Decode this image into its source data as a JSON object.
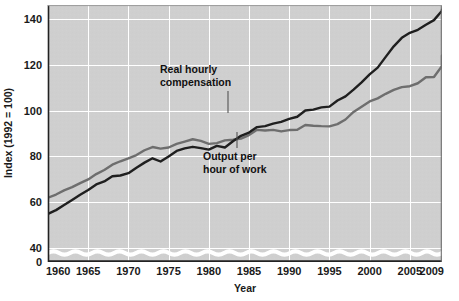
{
  "chart_data": {
    "type": "line",
    "title": "",
    "xlabel": "Year",
    "ylabel": "Index (1992 = 100)",
    "xlim": [
      1960,
      2009
    ],
    "ylim": [
      34,
      146
    ],
    "y_axis_break": true,
    "y_axis_break_note": "wavy break between 0 and 40",
    "grid": true,
    "grid_color": "#ffffff",
    "plot_background": "#cfcfcf",
    "legend_position": "inline annotations",
    "xticks": [
      "1960",
      "1965",
      "1970",
      "1975",
      "1980",
      "1985",
      "1990",
      "1995",
      "2000",
      "2005",
      "2009"
    ],
    "xtick_values": [
      1960,
      1965,
      1970,
      1975,
      1980,
      1985,
      1990,
      1995,
      2000,
      2005,
      2009
    ],
    "yticks": [
      "0",
      "40",
      "60",
      "80",
      "100",
      "120",
      "140"
    ],
    "ytick_values": [
      0,
      40,
      60,
      80,
      100,
      120,
      140
    ],
    "x": [
      1960,
      1961,
      1962,
      1963,
      1964,
      1965,
      1966,
      1967,
      1968,
      1969,
      1970,
      1971,
      1972,
      1973,
      1974,
      1975,
      1976,
      1977,
      1978,
      1979,
      1980,
      1981,
      1982,
      1983,
      1984,
      1985,
      1986,
      1987,
      1988,
      1989,
      1990,
      1991,
      1992,
      1993,
      1994,
      1995,
      1996,
      1997,
      1998,
      1999,
      2000,
      2001,
      2002,
      2003,
      2004,
      2005,
      2006,
      2007,
      2008,
      2009
    ],
    "series": [
      {
        "name": "Real hourly compensation",
        "color": "#6e6e6e",
        "label_x": 1978,
        "label_y": 112,
        "values": [
          62.0,
          63.4,
          65.2,
          66.6,
          68.4,
          70.0,
          72.3,
          74.1,
          76.4,
          77.9,
          79.2,
          80.6,
          82.7,
          84.1,
          83.4,
          83.9,
          85.5,
          86.5,
          87.5,
          86.8,
          85.5,
          85.8,
          87.0,
          87.3,
          87.8,
          89.3,
          91.6,
          91.3,
          91.6,
          90.9,
          91.5,
          91.6,
          93.7,
          93.4,
          93.2,
          93.1,
          94.1,
          96.1,
          99.4,
          101.7,
          104.0,
          105.3,
          107.3,
          109.0,
          110.2,
          110.6,
          111.9,
          114.5,
          114.6,
          119.4
        ],
        "end_value": 124.0
      },
      {
        "name": "Output per hour of work",
        "color": "#1f1f1f",
        "label_x": 1983,
        "label_y": 72,
        "values": [
          55.0,
          56.6,
          58.8,
          61.0,
          63.3,
          65.4,
          67.8,
          69.1,
          71.4,
          71.7,
          72.7,
          75.1,
          77.3,
          79.2,
          77.8,
          80.0,
          82.4,
          83.5,
          84.2,
          83.6,
          83.0,
          84.6,
          83.9,
          86.6,
          89.0,
          90.4,
          92.8,
          93.2,
          94.3,
          95.1,
          96.4,
          97.3,
          100.0,
          100.4,
          101.4,
          101.7,
          104.4,
          106.2,
          109.1,
          112.3,
          115.8,
          118.7,
          123.4,
          128.0,
          131.7,
          133.9,
          135.2,
          137.4,
          139.4,
          143.5
        ],
        "end_value": 144.0
      }
    ],
    "annotations": [
      {
        "name": "real-hourly-compensation",
        "line1": "Real hourly",
        "line2": "compensation"
      },
      {
        "name": "output-per-hour-of-work",
        "line1": "Output per",
        "line2": "hour of work"
      }
    ]
  }
}
